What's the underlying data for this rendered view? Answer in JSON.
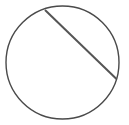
{
  "diagram": {
    "background": "#ffffff",
    "stroke_color": "#4a4a4a",
    "chord_color": "#555555",
    "circle": {
      "cx": 62.5,
      "cy": 62.5,
      "r": 56.5
    },
    "chord": {
      "x1": 45,
      "y1": 10,
      "x2": 116.5,
      "y2": 79
    }
  }
}
